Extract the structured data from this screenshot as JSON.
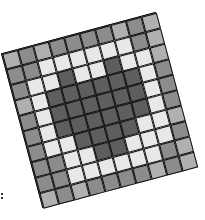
{
  "figure": {
    "rows": 10,
    "cols": 10,
    "rotation_deg": -15,
    "palette": {
      "W": "#e8e8e8",
      "L": "#b0b0b0",
      "M": "#8c8c8c",
      "D": "#5e5e5e"
    },
    "cells": [
      [
        "L",
        "M",
        "L",
        "M",
        "M",
        "M",
        "M",
        "L",
        "M",
        "L"
      ],
      [
        "M",
        "M",
        "W",
        "W",
        "W",
        "W",
        "W",
        "W",
        "M",
        "L"
      ],
      [
        "M",
        "W",
        "W",
        "D",
        "W",
        "W",
        "D",
        "W",
        "W",
        "L"
      ],
      [
        "L",
        "W",
        "D",
        "D",
        "D",
        "D",
        "D",
        "D",
        "W",
        "M"
      ],
      [
        "M",
        "W",
        "D",
        "D",
        "D",
        "D",
        "D",
        "D",
        "W",
        "M"
      ],
      [
        "M",
        "W",
        "D",
        "D",
        "D",
        "D",
        "D",
        "D",
        "W",
        "M"
      ],
      [
        "M",
        "W",
        "W",
        "D",
        "D",
        "D",
        "D",
        "W",
        "W",
        "L"
      ],
      [
        "M",
        "M",
        "W",
        "W",
        "D",
        "D",
        "W",
        "W",
        "W",
        "M"
      ],
      [
        "M",
        "M",
        "W",
        "W",
        "W",
        "W",
        "W",
        "W",
        "M",
        "L"
      ],
      [
        "L",
        "M",
        "L",
        "M",
        "M",
        "M",
        "M",
        "L",
        "M",
        "L"
      ]
    ]
  }
}
